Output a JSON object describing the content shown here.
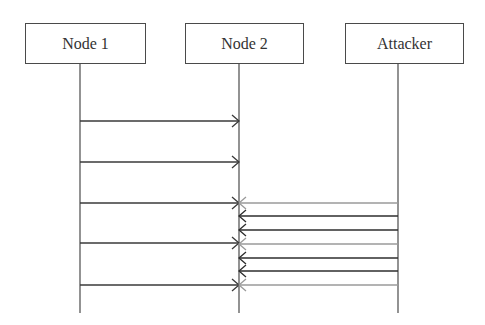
{
  "diagram": {
    "type": "sequence",
    "actors": [
      {
        "id": "node1",
        "label": "Node 1",
        "box_x": 25,
        "box_w": 121,
        "lifeline_x": 80
      },
      {
        "id": "node2",
        "label": "Node 2",
        "box_x": 185,
        "box_w": 119,
        "lifeline_x": 239
      },
      {
        "id": "attacker",
        "label": "Attacker",
        "box_x": 345,
        "box_w": 119,
        "lifeline_x": 398
      }
    ],
    "lifeline_top": 64,
    "lifeline_bottom": 313,
    "messages": [
      {
        "from": "node1",
        "to": "node2",
        "y": 121,
        "color": "#3a3a3a"
      },
      {
        "from": "node1",
        "to": "node2",
        "y": 162,
        "color": "#3a3a3a"
      },
      {
        "from": "node1",
        "to": "node2",
        "y": 203,
        "color": "#3a3a3a"
      },
      {
        "from": "node1",
        "to": "node2",
        "y": 243,
        "color": "#3a3a3a"
      },
      {
        "from": "node1",
        "to": "node2",
        "y": 285,
        "color": "#3a3a3a"
      },
      {
        "from": "attacker",
        "to": "node2",
        "y": 203,
        "color": "#9a9a9a"
      },
      {
        "from": "attacker",
        "to": "node2",
        "y": 216,
        "color": "#2e2e2e"
      },
      {
        "from": "attacker",
        "to": "node2",
        "y": 230,
        "color": "#2e2e2e"
      },
      {
        "from": "attacker",
        "to": "node2",
        "y": 244,
        "color": "#9a9a9a"
      },
      {
        "from": "attacker",
        "to": "node2",
        "y": 258,
        "color": "#2e2e2e"
      },
      {
        "from": "attacker",
        "to": "node2",
        "y": 271,
        "color": "#2e2e2e"
      },
      {
        "from": "attacker",
        "to": "node2",
        "y": 285,
        "color": "#9a9a9a"
      }
    ]
  }
}
